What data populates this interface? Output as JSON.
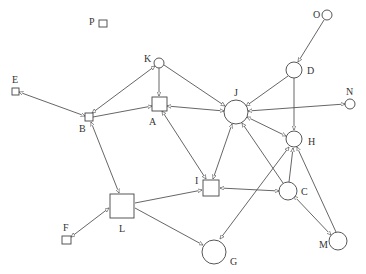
{
  "diagram": {
    "type": "directed-graph",
    "nodes": [
      {
        "id": "P",
        "label": "P",
        "shape": "square"
      },
      {
        "id": "E",
        "label": "E",
        "shape": "square"
      },
      {
        "id": "B",
        "label": "B",
        "shape": "square"
      },
      {
        "id": "K",
        "label": "K",
        "shape": "circle"
      },
      {
        "id": "A",
        "label": "A",
        "shape": "square"
      },
      {
        "id": "J",
        "label": "J",
        "shape": "circle"
      },
      {
        "id": "O",
        "label": "O",
        "shape": "circle"
      },
      {
        "id": "D",
        "label": "D",
        "shape": "circle"
      },
      {
        "id": "N",
        "label": "N",
        "shape": "circle"
      },
      {
        "id": "H",
        "label": "H",
        "shape": "circle"
      },
      {
        "id": "I",
        "label": "I",
        "shape": "square"
      },
      {
        "id": "C",
        "label": "C",
        "shape": "circle"
      },
      {
        "id": "L",
        "label": "L",
        "shape": "square"
      },
      {
        "id": "F",
        "label": "F",
        "shape": "square"
      },
      {
        "id": "G",
        "label": "G",
        "shape": "circle"
      },
      {
        "id": "M",
        "label": "M",
        "shape": "circle"
      }
    ],
    "edges": [
      {
        "from": "B",
        "to": "E"
      },
      {
        "from": "B",
        "to": "K"
      },
      {
        "from": "B",
        "to": "A"
      },
      {
        "from": "B",
        "to": "L"
      },
      {
        "from": "L",
        "to": "B"
      },
      {
        "from": "K",
        "to": "A"
      },
      {
        "from": "K",
        "to": "J"
      },
      {
        "from": "J",
        "to": "A"
      },
      {
        "from": "I",
        "to": "A"
      },
      {
        "from": "A",
        "to": "I"
      },
      {
        "from": "I",
        "to": "J"
      },
      {
        "from": "O",
        "to": "D"
      },
      {
        "from": "D",
        "to": "J"
      },
      {
        "from": "D",
        "to": "H"
      },
      {
        "from": "J",
        "to": "N"
      },
      {
        "from": "H",
        "to": "J"
      },
      {
        "from": "C",
        "to": "J"
      },
      {
        "from": "C",
        "to": "H"
      },
      {
        "from": "M",
        "to": "H"
      },
      {
        "from": "M",
        "to": "C"
      },
      {
        "from": "C",
        "to": "M"
      },
      {
        "from": "C",
        "to": "I"
      },
      {
        "from": "I",
        "to": "C"
      },
      {
        "from": "G",
        "to": "H"
      },
      {
        "from": "H",
        "to": "G"
      },
      {
        "from": "L",
        "to": "I"
      },
      {
        "from": "L",
        "to": "G"
      },
      {
        "from": "F",
        "to": "L"
      },
      {
        "from": "L",
        "to": "F"
      }
    ]
  },
  "labels": {
    "P": "P",
    "E": "E",
    "B": "B",
    "K": "K",
    "A": "A",
    "J": "J",
    "O": "O",
    "D": "D",
    "N": "N",
    "H": "H",
    "I": "I",
    "C": "C",
    "L": "L",
    "F": "F",
    "G": "G",
    "M": "M"
  }
}
